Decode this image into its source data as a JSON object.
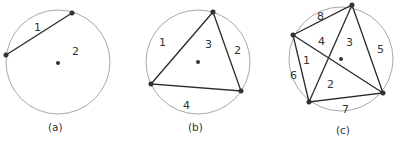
{
  "figure": {
    "panels": [
      {
        "caption": "(a)",
        "points_on_circle": 2,
        "region_labels": [
          "1",
          "2"
        ]
      },
      {
        "caption": "(b)",
        "points_on_circle": 3,
        "region_labels": [
          "1",
          "2",
          "3",
          "4"
        ]
      },
      {
        "caption": "(c)",
        "points_on_circle": 4,
        "region_labels": [
          "1",
          "2",
          "3",
          "4",
          "5",
          "6",
          "7",
          "8"
        ]
      }
    ]
  }
}
